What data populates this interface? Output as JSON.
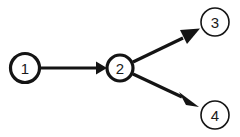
{
  "diagram": {
    "background_color": "#ffffff",
    "stroke_color": "#141414",
    "label_color": "#1a1a1a",
    "nodes": [
      {
        "id": "1",
        "label": "1",
        "cx": 25,
        "cy": 68,
        "r": 14.5,
        "stroke_width": 3.2,
        "name": "node-1"
      },
      {
        "id": "2",
        "label": "2",
        "cx": 120,
        "cy": 68,
        "r": 13.0,
        "stroke_width": 3.2,
        "name": "node-2"
      },
      {
        "id": "3",
        "label": "3",
        "cx": 215,
        "cy": 22,
        "r": 14.0,
        "stroke_width": 1.6,
        "name": "node-3"
      },
      {
        "id": "4",
        "label": "4",
        "cx": 215,
        "cy": 115,
        "r": 14.0,
        "stroke_width": 1.6,
        "name": "node-4"
      }
    ],
    "edges": [
      {
        "id": "e12",
        "from": "1",
        "to": "2",
        "name": "edge-1-to-2",
        "stroke_width": 3.2,
        "x1": 40,
        "y1": 68,
        "x2": 96,
        "y2": 68,
        "head": "96,61.5 107,68 96,74.5"
      },
      {
        "id": "e23",
        "from": "2",
        "to": "3",
        "name": "edge-2-to-3",
        "stroke_width": 3.2,
        "x1": 133,
        "y1": 62,
        "x2": 183,
        "y2": 38,
        "head": "180,30 200,28.5 187,44"
      },
      {
        "id": "e24",
        "from": "2",
        "to": "4",
        "name": "edge-2-to-4",
        "stroke_width": 3.2,
        "x1": 133,
        "y1": 74,
        "x2": 182,
        "y2": 97,
        "head": "179,92 199,107 186,105"
      }
    ]
  }
}
